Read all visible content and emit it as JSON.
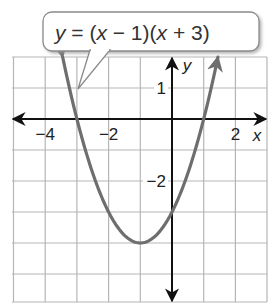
{
  "callout": {
    "text_parts": [
      "y",
      " = (",
      "x",
      " − 1)(",
      "x",
      " + 3)"
    ],
    "box": {
      "x": 43,
      "y": 12,
      "w": 216,
      "h": 39,
      "r": 9
    },
    "tail": [
      [
        90,
        50
      ],
      [
        110,
        50
      ],
      [
        78,
        89
      ]
    ]
  },
  "chart_data": {
    "type": "line",
    "title": "y = (x − 1)(x + 3)",
    "function": {
      "form": "factored",
      "roots": [
        1,
        -3
      ],
      "a": 1
    },
    "vertex": [
      -1,
      -4
    ],
    "y_intercept": -3,
    "xlabel": "x",
    "ylabel": "y",
    "xlim": [
      -5,
      3
    ],
    "ylim": [
      -5.9,
      2
    ],
    "x_tick_labels": [
      {
        "value": -4,
        "label": "−4"
      },
      {
        "value": -2,
        "label": "−2"
      },
      {
        "value": 2,
        "label": "2"
      }
    ],
    "y_tick_labels": [
      {
        "value": 1,
        "label": "1"
      },
      {
        "value": -2,
        "label": "−2"
      }
    ],
    "grid": true,
    "grid_step": 1,
    "curve_color": "#6e6e6e",
    "axis_color": "#111111",
    "grid_color": "#b5b5b5",
    "curve_arrows_at_y": 2
  },
  "layout": {
    "origin_px": [
      172,
      119
    ],
    "unit_x_px": 31.7,
    "unit_y_px": 31,
    "plot_left_px": 12,
    "plot_right_px": 267,
    "plot_top_px": 57,
    "plot_bottom_px": 302
  }
}
